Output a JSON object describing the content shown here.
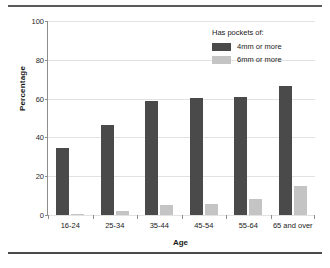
{
  "chart_data": {
    "type": "bar",
    "title": "",
    "xlabel": "Age",
    "ylabel": "Percentage",
    "categories": [
      "16-24",
      "25-34",
      "35-44",
      "45-54",
      "55-64",
      "65 and over"
    ],
    "series": [
      {
        "name": "4mm or more",
        "color": "#4a4a4a",
        "values": [
          34.5,
          46.5,
          59.0,
          60.5,
          61.0,
          66.5
        ]
      },
      {
        "name": "6mm or more",
        "color": "#c4c4c4",
        "values": [
          0.5,
          2.0,
          5.0,
          5.5,
          8.5,
          15.0
        ]
      }
    ],
    "ylim": [
      0,
      100
    ],
    "yticks": [
      0,
      20,
      40,
      60,
      80,
      100
    ],
    "ytick_labels": [
      "0",
      "20",
      "40",
      "60",
      "80",
      "100"
    ],
    "grid": true,
    "legend_position": "top-right",
    "legend_title": "Has pockets of:"
  }
}
